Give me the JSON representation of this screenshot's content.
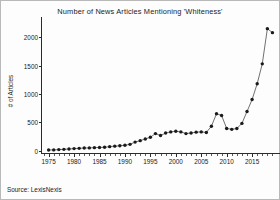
{
  "chart_data": {
    "type": "line",
    "title": "Number of News Articles Mentioning 'Whiteness'",
    "xlabel": "",
    "ylabel": "# of Articles",
    "xlim": [
      1973.5,
      2019.5
    ],
    "ylim": [
      -60,
      2250
    ],
    "grid": false,
    "legend": null,
    "marker": "filled-circle",
    "line_color": "#333333",
    "marker_color": "#1a1a1a",
    "xticks": [
      1975,
      1980,
      1985,
      1990,
      1995,
      2000,
      2005,
      2010,
      2015
    ],
    "xtick_labels": [
      "1975",
      "1980",
      "1985",
      "1990",
      "1995",
      "2000",
      "2005",
      "2010",
      "2015"
    ],
    "yticks": [
      0,
      500,
      1000,
      1500,
      2000
    ],
    "ytick_labels": [
      "0",
      "500",
      "1000",
      "1500",
      "2000"
    ],
    "x": [
      1975,
      1976,
      1977,
      1978,
      1979,
      1980,
      1981,
      1982,
      1983,
      1984,
      1985,
      1986,
      1987,
      1988,
      1989,
      1990,
      1991,
      1992,
      1993,
      1994,
      1995,
      1996,
      1997,
      1998,
      1999,
      2000,
      2001,
      2002,
      2003,
      2004,
      2005,
      2006,
      2007,
      2008,
      2009,
      2010,
      2011,
      2012,
      2013,
      2014,
      2015,
      2016,
      2017,
      2018,
      2019
    ],
    "values": [
      10,
      12,
      18,
      22,
      28,
      35,
      40,
      45,
      48,
      52,
      55,
      60,
      70,
      78,
      85,
      95,
      110,
      150,
      175,
      205,
      235,
      300,
      265,
      310,
      330,
      340,
      330,
      300,
      310,
      325,
      330,
      320,
      430,
      650,
      620,
      390,
      375,
      390,
      480,
      690,
      900,
      1180,
      1530,
      2150,
      2080
    ],
    "annotations": [
      "Source: LexisNexis"
    ]
  },
  "source": {
    "note": "Source: LexisNexis"
  }
}
